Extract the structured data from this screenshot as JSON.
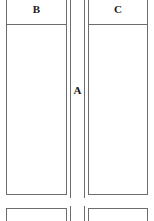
{
  "page": {
    "background_color": "#ffffff",
    "ink_color": "#6e6c6a",
    "text_color": "#1b1b1b",
    "width": 154,
    "height": 221
  },
  "tables": [
    {
      "name": "upper-table",
      "columns": [
        {
          "id": "B",
          "label": "B",
          "role": "left-column"
        },
        {
          "id": "A",
          "label": "A",
          "role": "middle-narrow-column"
        },
        {
          "id": "C",
          "label": "C",
          "role": "right-column"
        }
      ],
      "rows": [
        {
          "id": "header-row",
          "cells": [
            "B",
            "",
            "C"
          ]
        },
        {
          "id": "body-row",
          "cells": [
            "",
            "A",
            ""
          ]
        }
      ],
      "header_labels": {
        "left": "B",
        "right": "C"
      },
      "body_labels": {
        "middle": "A"
      }
    },
    {
      "name": "lower-table",
      "columns": [
        {
          "id": "B2",
          "label": "",
          "role": "left-column"
        },
        {
          "id": "A2",
          "label": "",
          "role": "middle-narrow-column"
        },
        {
          "id": "C2",
          "label": "",
          "role": "right-column"
        }
      ],
      "rows": [
        {
          "id": "header-row",
          "cells": [
            "",
            "",
            ""
          ]
        }
      ]
    }
  ]
}
